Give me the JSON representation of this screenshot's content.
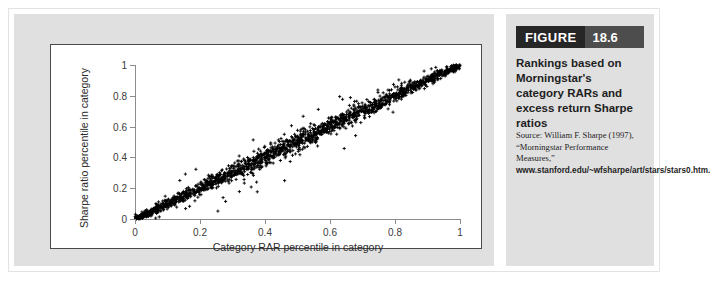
{
  "figure": {
    "tag_word": "FIGURE",
    "tag_number": "18.6",
    "caption_title": "Rankings based on Morningstar's category RARs and excess return Sharpe ratios",
    "source_prefix": "Source: William F. Sharpe (1997), “Morningstar Performance Measures,” ",
    "source_url": "www.stanford.edu/~wfsharpe/art/stars/stars0.htm."
  },
  "chart_data": {
    "type": "scatter",
    "title": "",
    "xlabel": "Category RAR percentile in category",
    "ylabel": "Sharpe ratio percentile in category",
    "xlim": [
      0,
      1
    ],
    "ylim": [
      0,
      1
    ],
    "xticks": [
      0,
      0.2,
      0.4,
      0.6,
      0.8,
      1
    ],
    "xticklabels": [
      "0",
      "0.2",
      "0.4",
      "0.6",
      "0.8",
      "1"
    ],
    "yticks": [
      0,
      0.2,
      0.4,
      0.6,
      0.8,
      1
    ],
    "yticklabels": [
      "0",
      "0.2",
      "0.4",
      "0.6",
      "0.8",
      "1"
    ],
    "grid": false,
    "legend": null,
    "marker": "+",
    "marker_color": "#000000",
    "series": [
      {
        "name": "Funds",
        "description": "Dense near-diagonal band of roughly 1800 funds; Sharpe ratio percentile is almost identical to category RAR percentile, with small symmetric scatter that widens slightly toward mid and upper range.",
        "n_points": 1800,
        "relationship": "y ~= x",
        "correlation": 0.99,
        "residual_sd": 0.018,
        "outlier_fraction": 0.06,
        "outlier_residual_sd": 0.055
      }
    ]
  }
}
